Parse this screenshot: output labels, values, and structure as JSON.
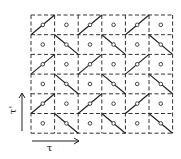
{
  "diagram": {
    "grid": {
      "rows": 6,
      "cols": 6,
      "origin_x": 31,
      "origin_y": 15,
      "cell_w": 23.6,
      "cell_h": 19.7,
      "line_color": "#333333",
      "dash": "4,2.5"
    },
    "cells": [
      [
        "slash",
        "dot",
        "slash",
        "dot",
        "slash",
        "dot"
      ],
      [
        "dot",
        "backslash",
        "dot",
        "backslash",
        "dot",
        "backslash"
      ],
      [
        "slash",
        "dot",
        "slash",
        "dot",
        "slash",
        "dot"
      ],
      [
        "dot",
        "backslash",
        "dot",
        "backslash",
        "dot",
        "backslash"
      ],
      [
        "slash",
        "dot",
        "slash",
        "dot",
        "slash",
        "dot"
      ],
      [
        "dot",
        "backslash",
        "dot",
        "backslash",
        "dot",
        "backslash"
      ]
    ],
    "axes": {
      "horizontal": {
        "label": "τ",
        "x1": 32,
        "y": 141,
        "x2": 79
      },
      "vertical": {
        "label": "τ'",
        "x": 22,
        "y1": 131,
        "y2": 93
      }
    }
  }
}
